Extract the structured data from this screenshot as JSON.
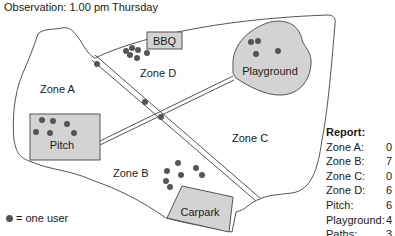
{
  "title": "Observation: 1.00 pm Thursday",
  "colors": {
    "dot": "#555555",
    "area_fill": "#d3d3d3",
    "line": "#555555"
  },
  "zones": [
    {
      "name": "Zone A",
      "users": 0
    },
    {
      "name": "Zone B",
      "users": 7
    },
    {
      "name": "Zone C",
      "users": 0
    },
    {
      "name": "Zone D",
      "users": 6
    }
  ],
  "facilities": [
    {
      "name": "BBQ"
    },
    {
      "name": "Playground",
      "users": 4
    },
    {
      "name": "Pitch",
      "users": 6
    },
    {
      "name": "Carpark"
    }
  ],
  "labels": {
    "zone_a": "Zone A",
    "zone_b": "Zone B",
    "zone_c": "Zone C",
    "zone_d": "Zone D",
    "bbq": "BBQ",
    "playground": "Playground",
    "pitch": "Pitch",
    "carpark": "Carpark"
  },
  "legend": {
    "icon": "dot-icon",
    "text": "= one user"
  },
  "report": {
    "header": "Report:",
    "rows": [
      {
        "label": "Zone A:",
        "value": "0"
      },
      {
        "label": "Zone B:",
        "value": "7"
      },
      {
        "label": "Zone C:",
        "value": "0"
      },
      {
        "label": "Zone D:",
        "value": "6"
      },
      {
        "label": "Pitch:",
        "value": "6"
      },
      {
        "label": "Playground:",
        "value": "4"
      },
      {
        "label": "Paths:",
        "value": "3"
      }
    ]
  }
}
